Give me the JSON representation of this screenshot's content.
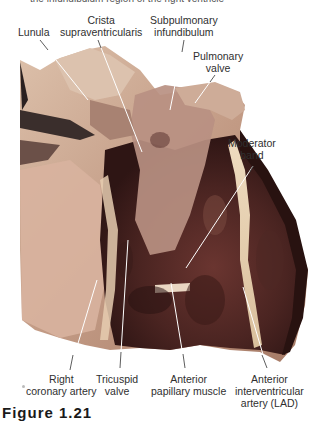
{
  "caption_top": "the infundibulum region of the right ventricle",
  "figure_number": "Figure 1.21",
  "specimen": {
    "description": "Dissected heart specimen, anterior view of right ventricle opened",
    "colors": {
      "flesh_light": "#d9b8a0",
      "flesh_mid": "#b48a74",
      "muscle_dark": "#5a2e2a",
      "muscle_deep": "#3a1c1a",
      "fat": "#e8d3b4",
      "background": "#ffffff"
    }
  },
  "labels": {
    "lunula": [
      "Lunula"
    ],
    "crista": [
      "Crista",
      "supraventricularis"
    ],
    "subpulmonary": [
      "Subpulmonary",
      "infundibulum"
    ],
    "pulmonary_valve": [
      "Pulmonary",
      "valve"
    ],
    "moderator_band": [
      "Moderator",
      "band"
    ],
    "right_coronary": [
      "Right",
      "coronary artery"
    ],
    "tricuspid": [
      "Tricuspid",
      "valve"
    ],
    "anterior_papillary": [
      "Anterior",
      "papillary muscle"
    ],
    "lad": [
      "Anterior",
      "interventricular",
      "artery (LAD)"
    ]
  }
}
